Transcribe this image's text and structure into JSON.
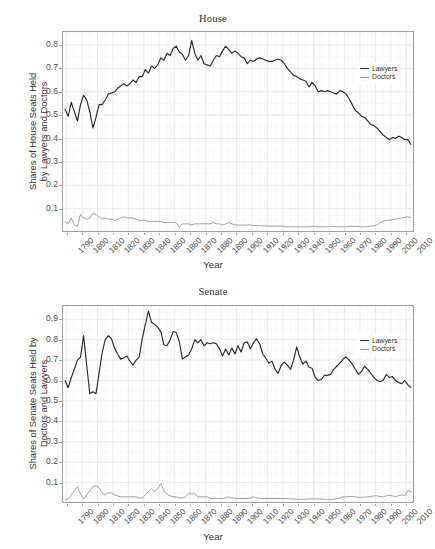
{
  "figure": {
    "xlabel": "Year",
    "legend": {
      "items": [
        "Lawyers",
        "Doctors"
      ]
    },
    "colors": {
      "lawyers": "#2b2b2b",
      "doctors": "#9a9a9a",
      "panel_border": "#a0a0a0",
      "grid_major": "#e6e6e6",
      "grid_minor": "#f2f2f2",
      "background": "#ffffff"
    }
  },
  "chart_data": [
    {
      "type": "line",
      "title": "House",
      "xlabel": "Year",
      "ylabel": "Shares of House Seats Held\nby Lawyers and Doctors",
      "xlim": [
        1787,
        2015
      ],
      "ylim": [
        0.0,
        0.86
      ],
      "xticks": [
        1790,
        1800,
        1810,
        1820,
        1830,
        1840,
        1850,
        1860,
        1870,
        1880,
        1890,
        1900,
        1910,
        1920,
        1930,
        1940,
        1950,
        1960,
        1970,
        1980,
        1990,
        2000,
        2010
      ],
      "yticks": [
        0.1,
        0.2,
        0.3,
        0.4,
        0.5,
        0.6,
        0.7,
        0.8
      ],
      "grid": true,
      "legend_position": "right-inside",
      "x": [
        1789,
        1791,
        1793,
        1795,
        1797,
        1799,
        1801,
        1803,
        1805,
        1807,
        1809,
        1811,
        1813,
        1815,
        1817,
        1819,
        1821,
        1823,
        1825,
        1827,
        1829,
        1831,
        1833,
        1835,
        1837,
        1839,
        1841,
        1843,
        1845,
        1847,
        1849,
        1851,
        1853,
        1855,
        1857,
        1859,
        1861,
        1863,
        1865,
        1867,
        1869,
        1871,
        1873,
        1875,
        1877,
        1879,
        1881,
        1883,
        1885,
        1887,
        1889,
        1891,
        1893,
        1895,
        1897,
        1899,
        1901,
        1903,
        1905,
        1907,
        1909,
        1911,
        1913,
        1915,
        1917,
        1919,
        1921,
        1923,
        1925,
        1927,
        1929,
        1931,
        1933,
        1935,
        1937,
        1939,
        1941,
        1943,
        1945,
        1947,
        1949,
        1951,
        1953,
        1955,
        1957,
        1959,
        1961,
        1963,
        1965,
        1967,
        1969,
        1971,
        1973,
        1975,
        1977,
        1979,
        1981,
        1983,
        1985,
        1987,
        1989,
        1991,
        1993,
        1995,
        1997,
        1999,
        2001,
        2003,
        2005,
        2007,
        2009,
        2011,
        2013
      ],
      "series": [
        {
          "name": "Lawyers",
          "color": "#2b2b2b",
          "values": [
            0.525,
            0.495,
            0.555,
            0.515,
            0.475,
            0.545,
            0.585,
            0.565,
            0.515,
            0.445,
            0.49,
            0.545,
            0.545,
            0.565,
            0.59,
            0.595,
            0.6,
            0.615,
            0.625,
            0.635,
            0.625,
            0.635,
            0.65,
            0.64,
            0.665,
            0.665,
            0.695,
            0.68,
            0.71,
            0.7,
            0.715,
            0.745,
            0.735,
            0.765,
            0.755,
            0.785,
            0.795,
            0.77,
            0.76,
            0.735,
            0.755,
            0.82,
            0.765,
            0.735,
            0.755,
            0.72,
            0.715,
            0.71,
            0.735,
            0.755,
            0.75,
            0.775,
            0.795,
            0.78,
            0.765,
            0.775,
            0.765,
            0.75,
            0.745,
            0.72,
            0.735,
            0.73,
            0.74,
            0.745,
            0.74,
            0.735,
            0.73,
            0.73,
            0.735,
            0.74,
            0.735,
            0.72,
            0.7,
            0.685,
            0.67,
            0.665,
            0.655,
            0.65,
            0.645,
            0.62,
            0.64,
            0.625,
            0.6,
            0.605,
            0.6,
            0.605,
            0.6,
            0.595,
            0.59,
            0.605,
            0.6,
            0.59,
            0.57,
            0.545,
            0.52,
            0.51,
            0.495,
            0.49,
            0.475,
            0.46,
            0.455,
            0.445,
            0.43,
            0.415,
            0.405,
            0.395,
            0.405,
            0.4,
            0.41,
            0.405,
            0.395,
            0.395,
            0.375
          ]
        },
        {
          "name": "Doctors",
          "color": "#9a9a9a",
          "values": [
            0.045,
            0.035,
            0.06,
            0.03,
            0.025,
            0.075,
            0.06,
            0.055,
            0.06,
            0.08,
            0.075,
            0.065,
            0.055,
            0.06,
            0.055,
            0.055,
            0.05,
            0.055,
            0.06,
            0.065,
            0.06,
            0.06,
            0.06,
            0.055,
            0.05,
            0.05,
            0.05,
            0.045,
            0.045,
            0.045,
            0.045,
            0.045,
            0.04,
            0.04,
            0.04,
            0.04,
            0.04,
            0.02,
            0.035,
            0.035,
            0.035,
            0.03,
            0.035,
            0.035,
            0.035,
            0.035,
            0.035,
            0.035,
            0.04,
            0.035,
            0.035,
            0.03,
            0.035,
            0.04,
            0.035,
            0.03,
            0.03,
            0.03,
            0.03,
            0.03,
            0.03,
            0.028,
            0.028,
            0.028,
            0.026,
            0.026,
            0.025,
            0.025,
            0.025,
            0.025,
            0.025,
            0.024,
            0.022,
            0.022,
            0.022,
            0.022,
            0.022,
            0.022,
            0.022,
            0.022,
            0.024,
            0.024,
            0.022,
            0.022,
            0.022,
            0.022,
            0.024,
            0.024,
            0.022,
            0.022,
            0.022,
            0.022,
            0.024,
            0.024,
            0.024,
            0.024,
            0.022,
            0.022,
            0.024,
            0.026,
            0.026,
            0.03,
            0.04,
            0.045,
            0.05,
            0.05,
            0.052,
            0.055,
            0.058,
            0.06,
            0.062,
            0.065,
            0.062
          ]
        }
      ]
    },
    {
      "type": "line",
      "title": "Senate",
      "xlabel": "Year",
      "ylabel": "Shares of Senate Seats Held by\nDoctors and Lawyers",
      "xlim": [
        1787,
        2015
      ],
      "ylim": [
        0.0,
        0.97
      ],
      "xticks": [
        1790,
        1800,
        1810,
        1820,
        1830,
        1840,
        1850,
        1860,
        1870,
        1880,
        1890,
        1900,
        1910,
        1920,
        1930,
        1940,
        1950,
        1960,
        1970,
        1980,
        1990,
        2000,
        2010
      ],
      "yticks": [
        0.1,
        0.2,
        0.3,
        0.4,
        0.5,
        0.6,
        0.7,
        0.8,
        0.9
      ],
      "grid": true,
      "legend_position": "right-inside",
      "x": [
        1789,
        1791,
        1793,
        1795,
        1797,
        1799,
        1801,
        1803,
        1805,
        1807,
        1809,
        1811,
        1813,
        1815,
        1817,
        1819,
        1821,
        1823,
        1825,
        1827,
        1829,
        1831,
        1833,
        1835,
        1837,
        1839,
        1841,
        1843,
        1845,
        1847,
        1849,
        1851,
        1853,
        1855,
        1857,
        1859,
        1861,
        1863,
        1865,
        1867,
        1869,
        1871,
        1873,
        1875,
        1877,
        1879,
        1881,
        1883,
        1885,
        1887,
        1889,
        1891,
        1893,
        1895,
        1897,
        1899,
        1901,
        1903,
        1905,
        1907,
        1909,
        1911,
        1913,
        1915,
        1917,
        1919,
        1921,
        1923,
        1925,
        1927,
        1929,
        1931,
        1933,
        1935,
        1937,
        1939,
        1941,
        1943,
        1945,
        1947,
        1949,
        1951,
        1953,
        1955,
        1957,
        1959,
        1961,
        1963,
        1965,
        1967,
        1969,
        1971,
        1973,
        1975,
        1977,
        1979,
        1981,
        1983,
        1985,
        1987,
        1989,
        1991,
        1993,
        1995,
        1997,
        1999,
        2001,
        2003,
        2005,
        2007,
        2009,
        2011,
        2013
      ],
      "series": [
        {
          "name": "Lawyers",
          "color": "#2b2b2b",
          "values": [
            0.6,
            0.565,
            0.615,
            0.655,
            0.7,
            0.715,
            0.82,
            0.675,
            0.535,
            0.545,
            0.535,
            0.635,
            0.735,
            0.8,
            0.82,
            0.805,
            0.76,
            0.73,
            0.705,
            0.71,
            0.72,
            0.695,
            0.675,
            0.7,
            0.715,
            0.805,
            0.875,
            0.94,
            0.885,
            0.875,
            0.86,
            0.84,
            0.775,
            0.77,
            0.8,
            0.84,
            0.835,
            0.79,
            0.705,
            0.715,
            0.725,
            0.755,
            0.8,
            0.785,
            0.8,
            0.77,
            0.785,
            0.78,
            0.785,
            0.78,
            0.755,
            0.72,
            0.755,
            0.725,
            0.76,
            0.73,
            0.77,
            0.74,
            0.785,
            0.79,
            0.755,
            0.785,
            0.805,
            0.78,
            0.73,
            0.71,
            0.685,
            0.695,
            0.655,
            0.635,
            0.675,
            0.69,
            0.675,
            0.655,
            0.7,
            0.765,
            0.715,
            0.68,
            0.695,
            0.665,
            0.66,
            0.615,
            0.6,
            0.605,
            0.625,
            0.625,
            0.63,
            0.655,
            0.67,
            0.685,
            0.705,
            0.715,
            0.7,
            0.68,
            0.655,
            0.63,
            0.645,
            0.67,
            0.655,
            0.635,
            0.615,
            0.6,
            0.595,
            0.6,
            0.63,
            0.615,
            0.62,
            0.6,
            0.59,
            0.585,
            0.6,
            0.58,
            0.565
          ]
        },
        {
          "name": "Doctors",
          "color": "#9a9a9a",
          "values": [
            0.015,
            0.02,
            0.04,
            0.06,
            0.08,
            0.045,
            0.02,
            0.04,
            0.06,
            0.08,
            0.085,
            0.075,
            0.05,
            0.04,
            0.05,
            0.05,
            0.04,
            0.035,
            0.03,
            0.03,
            0.03,
            0.03,
            0.03,
            0.03,
            0.025,
            0.025,
            0.04,
            0.055,
            0.07,
            0.055,
            0.07,
            0.095,
            0.06,
            0.045,
            0.035,
            0.03,
            0.03,
            0.025,
            0.025,
            0.03,
            0.045,
            0.045,
            0.045,
            0.03,
            0.03,
            0.03,
            0.03,
            0.022,
            0.022,
            0.022,
            0.022,
            0.022,
            0.025,
            0.03,
            0.025,
            0.022,
            0.022,
            0.022,
            0.022,
            0.022,
            0.025,
            0.03,
            0.025,
            0.022,
            0.022,
            0.022,
            0.022,
            0.022,
            0.022,
            0.022,
            0.022,
            0.022,
            0.022,
            0.02,
            0.02,
            0.018,
            0.018,
            0.018,
            0.018,
            0.02,
            0.02,
            0.02,
            0.02,
            0.02,
            0.018,
            0.018,
            0.018,
            0.018,
            0.022,
            0.025,
            0.03,
            0.03,
            0.032,
            0.032,
            0.03,
            0.028,
            0.028,
            0.028,
            0.03,
            0.032,
            0.035,
            0.035,
            0.032,
            0.03,
            0.035,
            0.038,
            0.035,
            0.032,
            0.035,
            0.04,
            0.035,
            0.062,
            0.055
          ]
        }
      ]
    }
  ]
}
